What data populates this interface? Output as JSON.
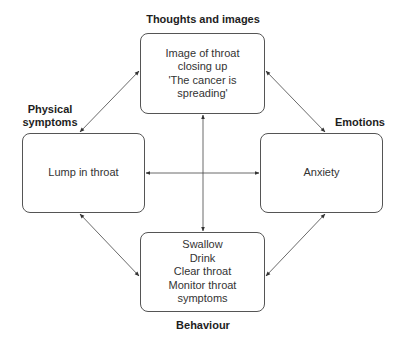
{
  "diagram": {
    "title_labels": {
      "thoughts": "Thoughts and images",
      "physical_line1": "Physical",
      "physical_line2": "symptoms",
      "emotions": "Emotions",
      "behaviour": "Behaviour"
    },
    "nodes": {
      "thoughts": {
        "lines": [
          "Image of throat",
          "closing up",
          "'The cancer is",
          "spreading'"
        ]
      },
      "physical": {
        "lines": [
          "Lump in throat"
        ]
      },
      "emotions": {
        "lines": [
          "Anxiety"
        ]
      },
      "behaviour": {
        "lines": [
          "Swallow",
          "Drink",
          "Clear throat",
          "Monitor throat",
          "symptoms"
        ]
      }
    },
    "edges": [
      {
        "from": "thoughts",
        "to": "physical",
        "type": "bidirectional"
      },
      {
        "from": "thoughts",
        "to": "emotions",
        "type": "bidirectional"
      },
      {
        "from": "physical",
        "to": "behaviour",
        "type": "bidirectional"
      },
      {
        "from": "emotions",
        "to": "behaviour",
        "type": "bidirectional"
      },
      {
        "from": "physical",
        "to": "emotions",
        "type": "bidirectional"
      },
      {
        "from": "thoughts",
        "to": "behaviour",
        "type": "bidirectional"
      }
    ],
    "colors": {
      "stroke": "#555555",
      "text": "#333333",
      "label": "#1e1e1e"
    }
  }
}
